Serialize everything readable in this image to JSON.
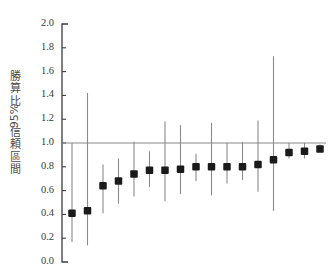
{
  "chart_data": {
    "type": "scatter",
    "title": "",
    "subtitle": "",
    "xlabel": "",
    "ylabel": "勝算比 95% 信頼區間",
    "ylabel_chars": [
      "勝",
      "算",
      "比",
      "95%",
      "信",
      "頼",
      "區",
      "間"
    ],
    "ylim": [
      0.0,
      2.0
    ],
    "ytick_values": [
      0.0,
      0.2,
      0.4,
      0.6,
      0.8,
      1.0,
      1.2,
      1.4,
      1.6,
      1.8,
      2.0
    ],
    "ytick_labels": [
      "0.0",
      "0.2",
      "0.4",
      "0.6",
      "0.8",
      "1.0",
      "1.2",
      "1.4",
      "1.6",
      "1.8",
      "2.0"
    ],
    "xtick_labels": [],
    "grid": false,
    "legend": null,
    "reference_line": {
      "value": 1.0,
      "orientation": "horizontal",
      "color": "#8a8a8a"
    },
    "marker_color": "#1a1a1a",
    "errorbar_color": "#8a8a8a",
    "axis_color": "#3d3d3d",
    "point_count": 16,
    "series": [
      {
        "name": "勝算比",
        "estimates": [
          0.41,
          0.43,
          0.64,
          0.68,
          0.74,
          0.77,
          0.77,
          0.78,
          0.8,
          0.8,
          0.8,
          0.8,
          0.82,
          0.86,
          0.92,
          0.93,
          0.95
        ],
        "ci_lower": [
          0.17,
          0.14,
          0.41,
          0.49,
          0.55,
          0.63,
          0.51,
          0.57,
          0.68,
          0.56,
          0.66,
          0.69,
          0.59,
          0.43,
          0.87,
          0.87,
          0.92
        ],
        "ci_upper": [
          1.0,
          1.42,
          0.82,
          0.87,
          1.01,
          0.93,
          1.18,
          1.15,
          0.91,
          1.17,
          1.0,
          1.01,
          1.19,
          1.73,
          1.0,
          1.0,
          0.99
        ]
      }
    ],
    "points": [
      {
        "index": 1,
        "or": 0.41,
        "ci_low": 0.17,
        "ci_high": 1.0
      },
      {
        "index": 2,
        "or": 0.43,
        "ci_low": 0.14,
        "ci_high": 1.42
      },
      {
        "index": 3,
        "or": 0.64,
        "ci_low": 0.41,
        "ci_high": 0.82
      },
      {
        "index": 4,
        "or": 0.68,
        "ci_low": 0.49,
        "ci_high": 0.87
      },
      {
        "index": 5,
        "or": 0.74,
        "ci_low": 0.55,
        "ci_high": 1.01
      },
      {
        "index": 6,
        "or": 0.77,
        "ci_low": 0.63,
        "ci_high": 0.93
      },
      {
        "index": 7,
        "or": 0.77,
        "ci_low": 0.51,
        "ci_high": 1.18
      },
      {
        "index": 8,
        "or": 0.78,
        "ci_low": 0.57,
        "ci_high": 1.15
      },
      {
        "index": 9,
        "or": 0.8,
        "ci_low": 0.68,
        "ci_high": 0.91
      },
      {
        "index": 10,
        "or": 0.8,
        "ci_low": 0.56,
        "ci_high": 1.17
      },
      {
        "index": 11,
        "or": 0.8,
        "ci_low": 0.66,
        "ci_high": 1.0
      },
      {
        "index": 12,
        "or": 0.8,
        "ci_low": 0.69,
        "ci_high": 1.01
      },
      {
        "index": 13,
        "or": 0.82,
        "ci_low": 0.59,
        "ci_high": 1.19
      },
      {
        "index": 14,
        "or": 0.86,
        "ci_low": 0.43,
        "ci_high": 1.73
      },
      {
        "index": 15,
        "or": 0.92,
        "ci_low": 0.87,
        "ci_high": 1.0
      },
      {
        "index": 16,
        "or": 0.93,
        "ci_low": 0.87,
        "ci_high": 1.0
      },
      {
        "index": 17,
        "or": 0.95,
        "ci_low": 0.92,
        "ci_high": 0.99
      }
    ]
  }
}
